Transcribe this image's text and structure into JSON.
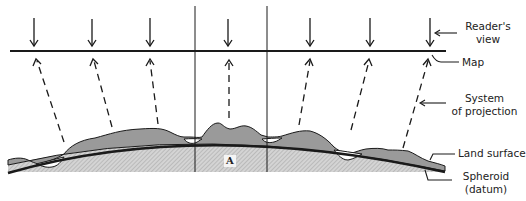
{
  "diagram": {
    "labels": {
      "readers_view_line1": "Reader's",
      "readers_view_line2": "view",
      "map": "Map",
      "system_line1": "System",
      "system_line2": "of projection",
      "land_surface": "Land surface",
      "spheroid_line1": "Spheroid",
      "spheroid_line2": "(datum)",
      "region_a": "A"
    },
    "colors": {
      "line": "#1a1a1a",
      "land_fill": "#9a9a9a",
      "spheroid_fill": "#c8c8c8",
      "hatch": "#b0b0b0",
      "background": "#ffffff"
    },
    "readers_view_arrows_x": [
      34,
      92,
      150,
      228,
      310,
      370,
      430
    ],
    "projection_arrows": [
      {
        "from": [
          64,
          142
        ],
        "to": [
          37,
          61
        ]
      },
      {
        "from": [
          112,
          127
        ],
        "to": [
          94,
          61
        ]
      },
      {
        "from": [
          158,
          124
        ],
        "to": [
          150,
          61
        ]
      },
      {
        "from": [
          229,
          118
        ],
        "to": [
          229,
          61
        ]
      },
      {
        "from": [
          299,
          125
        ],
        "to": [
          310,
          61
        ]
      },
      {
        "from": [
          351,
          130
        ],
        "to": [
          369,
          61
        ]
      },
      {
        "from": [
          403,
          148
        ],
        "to": [
          428,
          61
        ]
      }
    ]
  }
}
